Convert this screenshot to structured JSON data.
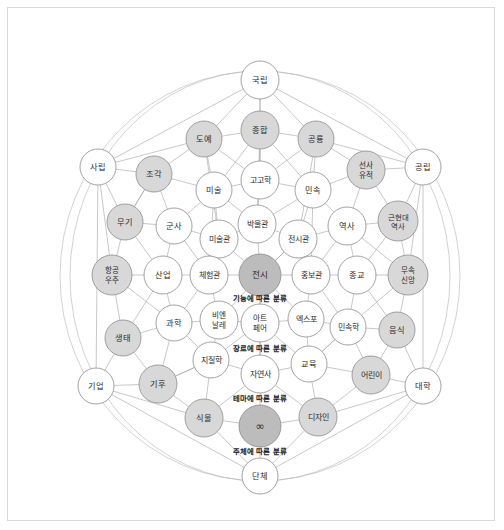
{
  "diagram": {
    "title": "",
    "colors": {
      "background": "#ffffff",
      "frame_border": "#d9d9d9",
      "edge": "#9a9a9a",
      "ring": "#b4b4b4",
      "node_stroke": "#8c8c8c",
      "node_fill_plain": "#ffffff",
      "node_fill_light": "#ededed",
      "node_fill_mid": "#d8d8d8",
      "node_fill_dark": "#bcbcbc",
      "label_text": "#2b2b2b",
      "group_text": "#1a1a1a"
    },
    "group_labels": [
      {
        "id": "group-function",
        "text": "기능에 따른 분류",
        "x": 252,
        "y": 290
      },
      {
        "id": "group-genre",
        "text": "장르에 따른 분류",
        "x": 252,
        "y": 340
      },
      {
        "id": "group-theme",
        "text": "테마에 따른 분류",
        "x": 252,
        "y": 390
      },
      {
        "id": "group-subject",
        "text": "주체에 따른 분류",
        "x": 252,
        "y": 443
      }
    ],
    "rings": [
      {
        "id": "ring-outer",
        "cx": 252,
        "cy": 268,
        "rx": 200,
        "ry": 205
      },
      {
        "id": "ring-left",
        "cx": 252,
        "cy": 268,
        "rx": 190,
        "ry": 205
      }
    ],
    "nodes": [
      {
        "id": "gungnip",
        "label": "국립",
        "x": 252,
        "y": 72,
        "r": 19,
        "fill": "plain",
        "fontsize": 8.2
      },
      {
        "id": "jonghap",
        "label": "종합",
        "x": 252,
        "y": 122,
        "r": 19,
        "fill": "mid",
        "fontsize": 8.2
      },
      {
        "id": "doye",
        "label": "도예",
        "x": 196,
        "y": 131,
        "r": 18,
        "fill": "mid",
        "fontsize": 8.2
      },
      {
        "id": "gongnyong",
        "label": "공룡",
        "x": 308,
        "y": 131,
        "r": 18,
        "fill": "mid",
        "fontsize": 8.2
      },
      {
        "id": "sarip",
        "label": "사립",
        "x": 90,
        "y": 159,
        "r": 18,
        "fill": "plain",
        "fontsize": 8.2
      },
      {
        "id": "jogak",
        "label": "조각",
        "x": 146,
        "y": 166,
        "r": 18,
        "fill": "mid",
        "fontsize": 8.2
      },
      {
        "id": "seonsayujeok",
        "label": "선사\n유적",
        "x": 358,
        "y": 162,
        "r": 19,
        "fill": "mid",
        "fontsize": 7.6
      },
      {
        "id": "gongnip",
        "label": "공립",
        "x": 415,
        "y": 159,
        "r": 18,
        "fill": "plain",
        "fontsize": 8.2
      },
      {
        "id": "gogohak",
        "label": "고고학",
        "x": 252,
        "y": 172,
        "r": 19,
        "fill": "plain",
        "fontsize": 8.0
      },
      {
        "id": "misul",
        "label": "미술",
        "x": 206,
        "y": 182,
        "r": 18,
        "fill": "plain",
        "fontsize": 8.2
      },
      {
        "id": "minsok",
        "label": "민속",
        "x": 305,
        "y": 182,
        "r": 18,
        "fill": "plain",
        "fontsize": 8.2
      },
      {
        "id": "geunhyeondae",
        "label": "근현대\n역사",
        "x": 390,
        "y": 213,
        "r": 20,
        "fill": "mid",
        "fontsize": 7.4
      },
      {
        "id": "mugi",
        "label": "무기",
        "x": 117,
        "y": 214,
        "r": 18,
        "fill": "mid",
        "fontsize": 8.2
      },
      {
        "id": "gunsa",
        "label": "군사",
        "x": 166,
        "y": 218,
        "r": 18,
        "fill": "plain",
        "fontsize": 8.2
      },
      {
        "id": "bangmulgwan",
        "label": "박물관",
        "x": 249,
        "y": 216,
        "r": 19,
        "fill": "plain",
        "fontsize": 8.0
      },
      {
        "id": "yeoksa",
        "label": "역사",
        "x": 339,
        "y": 218,
        "r": 19,
        "fill": "plain",
        "fontsize": 8.2
      },
      {
        "id": "misulgwan",
        "label": "미술관",
        "x": 211,
        "y": 231,
        "r": 19,
        "fill": "plain",
        "fontsize": 8.0
      },
      {
        "id": "jeonsigwan",
        "label": "전시관",
        "x": 290,
        "y": 231,
        "r": 19,
        "fill": "plain",
        "fontsize": 8.0
      },
      {
        "id": "hanggong",
        "label": "항공\n우주",
        "x": 104,
        "y": 267,
        "r": 20,
        "fill": "mid",
        "fontsize": 7.6
      },
      {
        "id": "saneop",
        "label": "산업",
        "x": 155,
        "y": 267,
        "r": 19,
        "fill": "plain",
        "fontsize": 8.2
      },
      {
        "id": "cheheomgwan",
        "label": "체험관",
        "x": 201,
        "y": 267,
        "r": 19,
        "fill": "plain",
        "fontsize": 8.0
      },
      {
        "id": "jeonsi",
        "label": "전시",
        "x": 252,
        "y": 267,
        "r": 21,
        "fill": "dark",
        "fontsize": 8.6
      },
      {
        "id": "hongbogwan",
        "label": "홍보관",
        "x": 303,
        "y": 267,
        "r": 19,
        "fill": "plain",
        "fontsize": 8.0
      },
      {
        "id": "jonggyo",
        "label": "종교",
        "x": 349,
        "y": 267,
        "r": 19,
        "fill": "plain",
        "fontsize": 8.2
      },
      {
        "id": "musok",
        "label": "무속\n신앙",
        "x": 400,
        "y": 267,
        "r": 20,
        "fill": "mid",
        "fontsize": 7.6
      },
      {
        "id": "saengtae",
        "label": "생태",
        "x": 115,
        "y": 330,
        "r": 18,
        "fill": "mid",
        "fontsize": 8.2
      },
      {
        "id": "gwahak",
        "label": "과학",
        "x": 166,
        "y": 315,
        "r": 18,
        "fill": "plain",
        "fontsize": 8.2
      },
      {
        "id": "biennale",
        "label": "비엔\n날레",
        "x": 211,
        "y": 312,
        "r": 19,
        "fill": "plain",
        "fontsize": 7.6
      },
      {
        "id": "artfair",
        "label": "아트\n페어",
        "x": 252,
        "y": 315,
        "r": 19,
        "fill": "plain",
        "fontsize": 7.6
      },
      {
        "id": "expo",
        "label": "엑스포",
        "x": 298,
        "y": 311,
        "r": 18,
        "fill": "plain",
        "fontsize": 8.0
      },
      {
        "id": "minsokhak",
        "label": "민속학",
        "x": 340,
        "y": 319,
        "r": 18,
        "fill": "plain",
        "fontsize": 8.0
      },
      {
        "id": "eumsik",
        "label": "음식",
        "x": 389,
        "y": 322,
        "r": 18,
        "fill": "mid",
        "fontsize": 8.2
      },
      {
        "id": "jijilhak",
        "label": "지질학",
        "x": 203,
        "y": 352,
        "r": 18,
        "fill": "plain",
        "fontsize": 8.0
      },
      {
        "id": "jayeonsa",
        "label": "자연사",
        "x": 252,
        "y": 366,
        "r": 19,
        "fill": "plain",
        "fontsize": 8.0
      },
      {
        "id": "gyoyuk",
        "label": "교육",
        "x": 301,
        "y": 356,
        "r": 18,
        "fill": "plain",
        "fontsize": 8.2
      },
      {
        "id": "eorini",
        "label": "어린이",
        "x": 363,
        "y": 367,
        "r": 19,
        "fill": "mid",
        "fontsize": 8.0
      },
      {
        "id": "giup",
        "label": "기업",
        "x": 88,
        "y": 378,
        "r": 18,
        "fill": "plain",
        "fontsize": 8.2
      },
      {
        "id": "gihu",
        "label": "기후",
        "x": 150,
        "y": 376,
        "r": 19,
        "fill": "mid",
        "fontsize": 8.2
      },
      {
        "id": "daehak",
        "label": "대학",
        "x": 415,
        "y": 378,
        "r": 18,
        "fill": "plain",
        "fontsize": 8.2
      },
      {
        "id": "sikmul",
        "label": "식물",
        "x": 196,
        "y": 410,
        "r": 19,
        "fill": "mid",
        "fontsize": 8.2
      },
      {
        "id": "infinity",
        "label": "∞",
        "x": 252,
        "y": 418,
        "r": 21,
        "fill": "dark",
        "fontsize": 11
      },
      {
        "id": "design",
        "label": "디자인",
        "x": 310,
        "y": 409,
        "r": 19,
        "fill": "mid",
        "fontsize": 8.0
      },
      {
        "id": "danche",
        "label": "단체",
        "x": 252,
        "y": 468,
        "r": 18,
        "fill": "plain",
        "fontsize": 8.2
      }
    ],
    "edges": [
      [
        "gungnip",
        "jonghap"
      ],
      [
        "gungnip",
        "doye"
      ],
      [
        "gungnip",
        "gongnyong"
      ],
      [
        "gungnip",
        "gogohak"
      ],
      [
        "gungnip",
        "sarip"
      ],
      [
        "gungnip",
        "gongnip"
      ],
      [
        "jonghap",
        "doye"
      ],
      [
        "jonghap",
        "gongnyong"
      ],
      [
        "jonghap",
        "gogohak"
      ],
      [
        "jonghap",
        "misul"
      ],
      [
        "jonghap",
        "minsok"
      ],
      [
        "jonghap",
        "bangmulgwan"
      ],
      [
        "doye",
        "jogak"
      ],
      [
        "doye",
        "misul"
      ],
      [
        "doye",
        "sarip"
      ],
      [
        "doye",
        "gogohak"
      ],
      [
        "doye",
        "misulgwan"
      ],
      [
        "gongnyong",
        "seonsayujeok"
      ],
      [
        "gongnyong",
        "minsok"
      ],
      [
        "gongnyong",
        "gongnip"
      ],
      [
        "gongnyong",
        "gogohak"
      ],
      [
        "gongnyong",
        "jeonsigwan"
      ],
      [
        "sarip",
        "jogak"
      ],
      [
        "sarip",
        "mugi"
      ],
      [
        "sarip",
        "hanggong"
      ],
      [
        "sarip",
        "giup"
      ],
      [
        "jogak",
        "misul"
      ],
      [
        "jogak",
        "gunsa"
      ],
      [
        "jogak",
        "mugi"
      ],
      [
        "seonsayujeok",
        "gongnip"
      ],
      [
        "seonsayujeok",
        "minsok"
      ],
      [
        "seonsayujeok",
        "yeoksa"
      ],
      [
        "seonsayujeok",
        "geunhyeondae"
      ],
      [
        "gongnip",
        "geunhyeondae"
      ],
      [
        "gongnip",
        "musok"
      ],
      [
        "gongnip",
        "daehak"
      ],
      [
        "gogohak",
        "misul"
      ],
      [
        "gogohak",
        "minsok"
      ],
      [
        "gogohak",
        "bangmulgwan"
      ],
      [
        "misul",
        "misulgwan"
      ],
      [
        "misul",
        "gunsa"
      ],
      [
        "misul",
        "bangmulgwan"
      ],
      [
        "minsok",
        "yeoksa"
      ],
      [
        "minsok",
        "jeonsigwan"
      ],
      [
        "minsok",
        "bangmulgwan"
      ],
      [
        "geunhyeondae",
        "yeoksa"
      ],
      [
        "geunhyeondae",
        "musok"
      ],
      [
        "geunhyeondae",
        "jonggyo"
      ],
      [
        "mugi",
        "gunsa"
      ],
      [
        "mugi",
        "hanggong"
      ],
      [
        "mugi",
        "saneop"
      ],
      [
        "gunsa",
        "misulgwan"
      ],
      [
        "gunsa",
        "saneop"
      ],
      [
        "gunsa",
        "cheheomgwan"
      ],
      [
        "bangmulgwan",
        "misulgwan"
      ],
      [
        "bangmulgwan",
        "jeonsigwan"
      ],
      [
        "bangmulgwan",
        "jeonsi"
      ],
      [
        "yeoksa",
        "jeonsigwan"
      ],
      [
        "yeoksa",
        "jonggyo"
      ],
      [
        "yeoksa",
        "musok"
      ],
      [
        "yeoksa",
        "hongbogwan"
      ],
      [
        "misulgwan",
        "cheheomgwan"
      ],
      [
        "misulgwan",
        "jeonsi"
      ],
      [
        "jeonsigwan",
        "jeonsi"
      ],
      [
        "jeonsigwan",
        "hongbogwan"
      ],
      [
        "hanggong",
        "saneop"
      ],
      [
        "hanggong",
        "saengtae"
      ],
      [
        "hanggong",
        "gwahak"
      ],
      [
        "saneop",
        "cheheomgwan"
      ],
      [
        "saneop",
        "gwahak"
      ],
      [
        "saneop",
        "saengtae"
      ],
      [
        "cheheomgwan",
        "jeonsi"
      ],
      [
        "cheheomgwan",
        "biennale"
      ],
      [
        "cheheomgwan",
        "gwahak"
      ],
      [
        "jeonsi",
        "hongbogwan"
      ],
      [
        "jeonsi",
        "artfair"
      ],
      [
        "jeonsi",
        "biennale"
      ],
      [
        "jeonsi",
        "expo"
      ],
      [
        "jeonsi",
        "jayeonsa"
      ],
      [
        "hongbogwan",
        "jonggyo"
      ],
      [
        "hongbogwan",
        "expo"
      ],
      [
        "hongbogwan",
        "minsokhak"
      ],
      [
        "jonggyo",
        "musok"
      ],
      [
        "jonggyo",
        "minsokhak"
      ],
      [
        "jonggyo",
        "eumsik"
      ],
      [
        "musok",
        "eumsik"
      ],
      [
        "musok",
        "minsokhak"
      ],
      [
        "saengtae",
        "gwahak"
      ],
      [
        "saengtae",
        "gihu"
      ],
      [
        "saengtae",
        "giup"
      ],
      [
        "gwahak",
        "biennale"
      ],
      [
        "gwahak",
        "jijilhak"
      ],
      [
        "gwahak",
        "gihu"
      ],
      [
        "biennale",
        "artfair"
      ],
      [
        "biennale",
        "jijilhak"
      ],
      [
        "artfair",
        "expo"
      ],
      [
        "artfair",
        "jayeonsa"
      ],
      [
        "artfair",
        "jijilhak"
      ],
      [
        "artfair",
        "gyoyuk"
      ],
      [
        "expo",
        "minsokhak"
      ],
      [
        "expo",
        "gyoyuk"
      ],
      [
        "minsokhak",
        "eumsik"
      ],
      [
        "minsokhak",
        "eorini"
      ],
      [
        "minsokhak",
        "gyoyuk"
      ],
      [
        "eumsik",
        "eorini"
      ],
      [
        "eumsik",
        "daehak"
      ],
      [
        "jijilhak",
        "jayeonsa"
      ],
      [
        "jijilhak",
        "gihu"
      ],
      [
        "jijilhak",
        "sikmul"
      ],
      [
        "jayeonsa",
        "gyoyuk"
      ],
      [
        "jayeonsa",
        "sikmul"
      ],
      [
        "jayeonsa",
        "infinity"
      ],
      [
        "jayeonsa",
        "design"
      ],
      [
        "gyoyuk",
        "eorini"
      ],
      [
        "gyoyuk",
        "design"
      ],
      [
        "eorini",
        "daehak"
      ],
      [
        "eorini",
        "design"
      ],
      [
        "giup",
        "gihu"
      ],
      [
        "giup",
        "sikmul"
      ],
      [
        "giup",
        "danche"
      ],
      [
        "gihu",
        "sikmul"
      ],
      [
        "gihu",
        "jijilhak"
      ],
      [
        "daehak",
        "design"
      ],
      [
        "daehak",
        "danche"
      ],
      [
        "sikmul",
        "infinity"
      ],
      [
        "sikmul",
        "danche"
      ],
      [
        "infinity",
        "design"
      ],
      [
        "infinity",
        "danche"
      ],
      [
        "design",
        "danche"
      ],
      [
        "minsok",
        "hongbogwan"
      ],
      [
        "misul",
        "cheheomgwan"
      ],
      [
        "mugi",
        "jogak"
      ],
      [
        "gyoyuk",
        "minsokhak"
      ],
      [
        "jeonsi",
        "jeonsigwan"
      ]
    ]
  }
}
